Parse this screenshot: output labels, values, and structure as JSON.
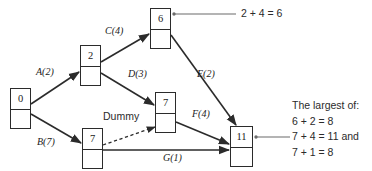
{
  "diagram": {
    "type": "project-network",
    "nodes": [
      {
        "id": "n0",
        "label": "0",
        "x": 10,
        "y": 88,
        "w": 21,
        "h": 41
      },
      {
        "id": "n2",
        "label": "2",
        "x": 80,
        "y": 45,
        "w": 21,
        "h": 41
      },
      {
        "id": "n6",
        "label": "6",
        "x": 150,
        "y": 8,
        "w": 21,
        "h": 41
      },
      {
        "id": "n7m",
        "label": "7",
        "x": 155,
        "y": 92,
        "w": 21,
        "h": 41
      },
      {
        "id": "n7b",
        "label": "7",
        "x": 82,
        "y": 128,
        "w": 21,
        "h": 41
      },
      {
        "id": "n11",
        "label": "11",
        "x": 230,
        "y": 126,
        "w": 23,
        "h": 41
      }
    ],
    "edges": [
      {
        "id": "A",
        "from": "n0",
        "to": "n2",
        "label": "A(2)",
        "letter": "A",
        "duration": 2,
        "style": "solid"
      },
      {
        "id": "B",
        "from": "n0",
        "to": "n7b",
        "label": "B(7)",
        "letter": "B",
        "duration": 7,
        "style": "solid"
      },
      {
        "id": "C",
        "from": "n2",
        "to": "n6",
        "label": "C(4)",
        "letter": "C",
        "duration": 4,
        "style": "solid"
      },
      {
        "id": "D",
        "from": "n2",
        "to": "n7m",
        "label": "D(3)",
        "letter": "D",
        "duration": 3,
        "style": "solid"
      },
      {
        "id": "E",
        "from": "n6",
        "to": "n11",
        "label": "E(2)",
        "letter": "E",
        "duration": 2,
        "style": "solid"
      },
      {
        "id": "F",
        "from": "n7m",
        "to": "n11",
        "label": "F(4)",
        "letter": "F",
        "duration": 4,
        "style": "solid"
      },
      {
        "id": "G",
        "from": "n7b",
        "to": "n11",
        "label": "G(1)",
        "letter": "G",
        "duration": 1,
        "style": "solid"
      },
      {
        "id": "Dummy",
        "from": "n7b",
        "to": "n7m",
        "label": "Dummy",
        "letter": "Dummy",
        "duration": 0,
        "style": "dashed"
      }
    ],
    "annotations": {
      "top_callout": "2 + 4 = 6",
      "right_callout": {
        "heading": "The largest of:",
        "lines": [
          "6 + 2 = 8",
          "7 + 4 = 11 and",
          "7 + 1 = 8"
        ]
      }
    },
    "colors": {
      "stroke": "#2b2b2b",
      "text": "#1a1a1a",
      "annotation_text": "#2b2b2b",
      "background": "#ffffff"
    }
  }
}
